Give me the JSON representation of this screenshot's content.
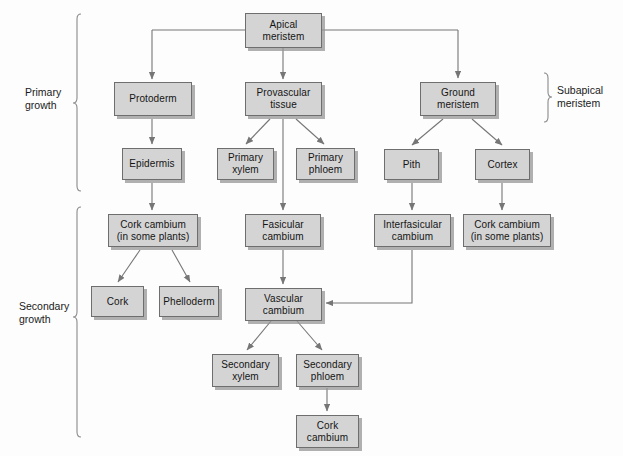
{
  "diagram": {
    "brackets": [
      {
        "name": "primary-growth",
        "label": "Primary\ngrowth"
      },
      {
        "name": "secondary-growth",
        "label": "Secondary\ngrowth"
      },
      {
        "name": "subapical-meristem",
        "label": "Subapical\nmeristem"
      }
    ],
    "colors": {
      "box_fill": "#d4d4d4",
      "box_border": "#6e6e6e",
      "shadow": "#969696",
      "connector": "#767676",
      "text": "#141414",
      "background": "#fdfdfd"
    },
    "nodes": [
      {
        "id": "apical-meristem",
        "label": "Apical\nmeristem"
      },
      {
        "id": "protoderm",
        "label": "Protoderm"
      },
      {
        "id": "provascular-tissue",
        "label": "Provascular\ntissue"
      },
      {
        "id": "ground-meristem",
        "label": "Ground\nmeristem"
      },
      {
        "id": "epidermis",
        "label": "Epidermis"
      },
      {
        "id": "primary-xylem",
        "label": "Primary\nxylem"
      },
      {
        "id": "primary-phloem",
        "label": "Primary\nphloem"
      },
      {
        "id": "pith",
        "label": "Pith"
      },
      {
        "id": "cortex",
        "label": "Cortex"
      },
      {
        "id": "cork-cambium-left",
        "label": "Cork cambium\n(in some plants)"
      },
      {
        "id": "fasicular-cambium",
        "label": "Fasicular\ncambium"
      },
      {
        "id": "interfasicular-cambium",
        "label": "Interfasicular\ncambium"
      },
      {
        "id": "cork-cambium-right",
        "label": "Cork cambium\n(in some plants)"
      },
      {
        "id": "cork",
        "label": "Cork"
      },
      {
        "id": "phelloderm",
        "label": "Phelloderm"
      },
      {
        "id": "vascular-cambium",
        "label": "Vascular\ncambium"
      },
      {
        "id": "secondary-xylem",
        "label": "Secondary\nxylem"
      },
      {
        "id": "secondary-phloem",
        "label": "Secondary\nphloem"
      },
      {
        "id": "cork-cambium-bottom",
        "label": "Cork\ncambium"
      }
    ],
    "edges": [
      {
        "from": "apical-meristem",
        "to": "protoderm"
      },
      {
        "from": "apical-meristem",
        "to": "provascular-tissue"
      },
      {
        "from": "apical-meristem",
        "to": "ground-meristem"
      },
      {
        "from": "protoderm",
        "to": "epidermis"
      },
      {
        "from": "provascular-tissue",
        "to": "primary-xylem"
      },
      {
        "from": "provascular-tissue",
        "to": "primary-phloem"
      },
      {
        "from": "provascular-tissue",
        "to": "fasicular-cambium"
      },
      {
        "from": "ground-meristem",
        "to": "pith"
      },
      {
        "from": "ground-meristem",
        "to": "cortex"
      },
      {
        "from": "epidermis",
        "to": "cork-cambium-left"
      },
      {
        "from": "pith",
        "to": "interfasicular-cambium"
      },
      {
        "from": "cortex",
        "to": "cork-cambium-right"
      },
      {
        "from": "cork-cambium-left",
        "to": "cork"
      },
      {
        "from": "cork-cambium-left",
        "to": "phelloderm"
      },
      {
        "from": "fasicular-cambium",
        "to": "vascular-cambium"
      },
      {
        "from": "interfasicular-cambium",
        "to": "vascular-cambium"
      },
      {
        "from": "vascular-cambium",
        "to": "secondary-xylem"
      },
      {
        "from": "vascular-cambium",
        "to": "secondary-phloem"
      },
      {
        "from": "secondary-phloem",
        "to": "cork-cambium-bottom"
      }
    ]
  }
}
